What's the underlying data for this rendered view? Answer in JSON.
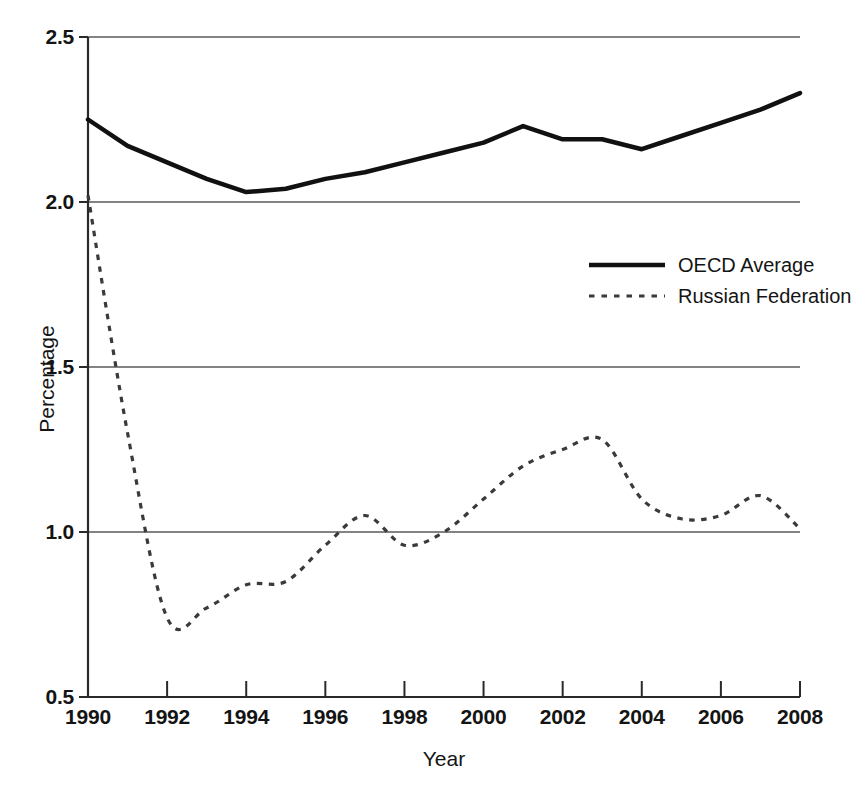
{
  "chart_data": {
    "type": "line",
    "title": "",
    "xlabel": "Year",
    "ylabel": "Percentage",
    "xlim": [
      1990,
      2008
    ],
    "ylim": [
      0.5,
      2.5
    ],
    "xticks": [
      "1990",
      "1992",
      "1994",
      "1996",
      "1998",
      "2000",
      "2002",
      "2004",
      "2006",
      "2008"
    ],
    "yticks": [
      "0.5",
      "1.0",
      "1.5",
      "2.0",
      "2.5"
    ],
    "grid": "horizontal",
    "legend_position": "upper-right-inside",
    "x": [
      1990,
      1991,
      1992,
      1993,
      1994,
      1995,
      1996,
      1997,
      1998,
      1999,
      2000,
      2001,
      2002,
      2003,
      2004,
      2005,
      2006,
      2007,
      2008
    ],
    "series": [
      {
        "name": "OECD Average",
        "style": "solid",
        "color": "#111111",
        "width": 4.5,
        "values": [
          2.25,
          2.17,
          2.12,
          2.07,
          2.03,
          2.04,
          2.07,
          2.09,
          2.12,
          2.15,
          2.18,
          2.23,
          2.19,
          2.19,
          2.16,
          2.2,
          2.24,
          2.28,
          2.33
        ]
      },
      {
        "name": "Russian Federation",
        "style": "dotted",
        "color": "#3a3a3a",
        "width": 3.2,
        "values": [
          2.02,
          1.3,
          0.74,
          0.77,
          0.84,
          0.85,
          0.96,
          1.05,
          0.96,
          1.0,
          1.1,
          1.2,
          1.25,
          1.28,
          1.1,
          1.04,
          1.05,
          1.11,
          1.01
        ]
      }
    ]
  },
  "legend": {
    "entries": [
      {
        "label": "OECD Average",
        "style": "solid"
      },
      {
        "label": "Russian Federation",
        "style": "dotted"
      }
    ]
  }
}
